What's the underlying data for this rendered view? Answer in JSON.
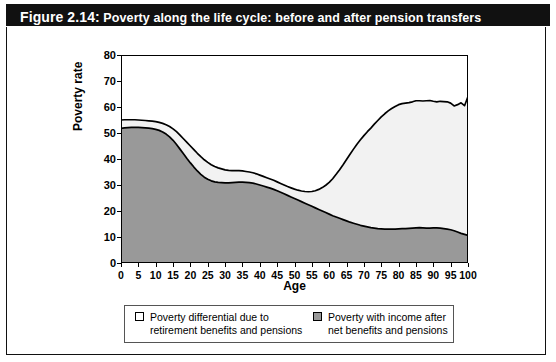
{
  "figure": {
    "number": "Figure 2.14:",
    "caption": "Poverty along the life cycle: before and after pension transfers",
    "title_full": "Figure 2.14: Poverty along the life cycle: before and after pension transfers"
  },
  "legend": {
    "items": [
      {
        "label": "Poverty differential due to\nretirement benefits and pensions",
        "swatch": "white",
        "color": "#ffffff"
      },
      {
        "label": "Poverty with income after\nnet benefits and pensions",
        "swatch": "gray",
        "color": "#999999"
      }
    ]
  },
  "chart_data": {
    "type": "area",
    "stacked": true,
    "title": "Poverty along the life cycle: before and after pension transfers",
    "xlabel": "Age",
    "ylabel": "Poverty rate",
    "xlim": [
      0,
      100
    ],
    "ylim": [
      0,
      80
    ],
    "xticks": [
      0,
      5,
      10,
      15,
      20,
      25,
      30,
      35,
      40,
      45,
      50,
      55,
      60,
      65,
      70,
      75,
      80,
      85,
      90,
      95,
      100
    ],
    "yticks": [
      0,
      10,
      20,
      30,
      40,
      50,
      60,
      70,
      80
    ],
    "grid": false,
    "legend_position": "bottom",
    "x": [
      0,
      1,
      2,
      3,
      4,
      5,
      6,
      7,
      8,
      9,
      10,
      11,
      12,
      13,
      14,
      15,
      16,
      17,
      18,
      19,
      20,
      21,
      22,
      23,
      24,
      25,
      26,
      27,
      28,
      29,
      30,
      31,
      32,
      33,
      34,
      35,
      36,
      37,
      38,
      39,
      40,
      41,
      42,
      43,
      44,
      45,
      46,
      47,
      48,
      49,
      50,
      51,
      52,
      53,
      54,
      55,
      56,
      57,
      58,
      59,
      60,
      61,
      62,
      63,
      64,
      65,
      66,
      67,
      68,
      69,
      70,
      71,
      72,
      73,
      74,
      75,
      76,
      77,
      78,
      79,
      80,
      81,
      82,
      83,
      84,
      85,
      86,
      87,
      88,
      89,
      90,
      91,
      92,
      93,
      94,
      95,
      96,
      97,
      98,
      99,
      100
    ],
    "series": [
      {
        "name": "Poverty with income after net benefits and pensions",
        "order": "bottom",
        "color": "#999999",
        "values": [
          51.8,
          52.0,
          52.1,
          52.2,
          52.2,
          52.2,
          52.1,
          52.0,
          51.9,
          51.7,
          51.4,
          51.0,
          50.4,
          49.6,
          48.5,
          47.2,
          45.6,
          43.8,
          42.0,
          40.2,
          38.5,
          36.9,
          35.4,
          34.1,
          33.0,
          32.2,
          31.6,
          31.2,
          31.0,
          30.9,
          30.8,
          30.8,
          30.9,
          31.0,
          31.1,
          31.1,
          31.0,
          30.9,
          30.7,
          30.4,
          30.0,
          29.6,
          29.2,
          28.8,
          28.3,
          27.8,
          27.2,
          26.6,
          26.0,
          25.4,
          24.8,
          24.2,
          23.6,
          23.0,
          22.4,
          21.8,
          21.2,
          20.6,
          20.0,
          19.4,
          18.8,
          18.2,
          17.7,
          17.2,
          16.7,
          16.2,
          15.7,
          15.3,
          14.9,
          14.5,
          14.2,
          13.9,
          13.6,
          13.4,
          13.2,
          13.1,
          13.0,
          13.0,
          13.0,
          13.0,
          13.1,
          13.2,
          13.2,
          13.3,
          13.4,
          13.5,
          13.6,
          13.5,
          13.4,
          13.4,
          13.5,
          13.5,
          13.4,
          13.2,
          13.0,
          12.8,
          12.4,
          11.9,
          11.4,
          11.0,
          10.6
        ]
      },
      {
        "name": "Poverty differential due to retirement benefits and pensions",
        "order": "top",
        "color": "#f2f2f2",
        "values": [
          3.2,
          3.1,
          3.0,
          2.9,
          2.9,
          2.8,
          2.8,
          2.8,
          2.8,
          2.9,
          3.0,
          3.1,
          3.3,
          3.6,
          4.0,
          4.4,
          4.9,
          5.4,
          5.8,
          6.2,
          6.5,
          6.7,
          6.8,
          6.8,
          6.7,
          6.5,
          6.2,
          5.9,
          5.6,
          5.3,
          5.0,
          4.8,
          4.6,
          4.5,
          4.4,
          4.3,
          4.2,
          4.1,
          4.0,
          3.9,
          3.8,
          3.7,
          3.6,
          3.5,
          3.5,
          3.4,
          3.4,
          3.4,
          3.4,
          3.5,
          3.6,
          3.8,
          4.1,
          4.5,
          5.0,
          5.7,
          6.6,
          7.7,
          9.0,
          10.5,
          12.2,
          14.2,
          16.4,
          18.7,
          21.1,
          23.6,
          26.1,
          28.5,
          30.8,
          32.9,
          34.8,
          36.6,
          38.3,
          40.0,
          41.6,
          43.1,
          44.4,
          45.5,
          46.4,
          47.2,
          47.8,
          48.1,
          48.3,
          48.4,
          48.6,
          48.9,
          48.8,
          48.8,
          49.0,
          49.1,
          48.7,
          48.5,
          48.8,
          48.9,
          49.0,
          48.7,
          48.0,
          49.0,
          50.2,
          49.5,
          53.4
        ]
      }
    ],
    "total_label": "Poverty before pension transfers (sum of both areas)",
    "total_values": [
      55.0,
      55.1,
      55.1,
      55.1,
      55.1,
      55.0,
      54.9,
      54.8,
      54.7,
      54.6,
      54.4,
      54.1,
      53.7,
      53.2,
      52.5,
      51.6,
      50.5,
      49.2,
      47.8,
      46.4,
      45.0,
      43.6,
      42.2,
      40.9,
      39.7,
      38.7,
      37.8,
      37.1,
      36.6,
      36.2,
      35.8,
      35.6,
      35.5,
      35.5,
      35.5,
      35.4,
      35.2,
      35.0,
      34.7,
      34.3,
      33.8,
      33.3,
      32.8,
      32.3,
      31.8,
      31.2,
      30.6,
      30.0,
      29.4,
      28.9,
      28.4,
      28.0,
      27.7,
      27.5,
      27.4,
      27.5,
      27.8,
      28.3,
      29.0,
      29.9,
      31.0,
      32.4,
      34.1,
      35.9,
      37.8,
      39.8,
      41.8,
      43.8,
      45.7,
      47.4,
      49.0,
      50.5,
      51.9,
      53.4,
      54.8,
      56.2,
      57.4,
      58.5,
      59.4,
      60.2,
      60.9,
      61.3,
      61.5,
      61.7,
      62.0,
      62.4,
      62.4,
      62.3,
      62.4,
      62.5,
      62.2,
      62.0,
      62.2,
      62.1,
      62.0,
      61.5,
      60.4,
      60.9,
      61.6,
      60.5,
      64.0
    ]
  }
}
